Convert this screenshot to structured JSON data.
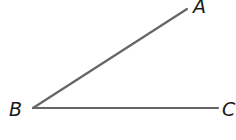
{
  "diagram": {
    "type": "angle",
    "stroke_color": "#666666",
    "label_color": "#1a1a1a",
    "vertex": {
      "name": "B",
      "x": 33,
      "y": 108
    },
    "rays": [
      {
        "name": "BA",
        "from": "B",
        "to": "A",
        "x1": 33,
        "y1": 108,
        "x2": 187,
        "y2": 9
      },
      {
        "name": "BC",
        "from": "B",
        "to": "C",
        "x1": 33,
        "y1": 108,
        "x2": 218,
        "y2": 108
      }
    ],
    "points": [
      {
        "label": "A",
        "x": 187,
        "y": 9
      },
      {
        "label": "B",
        "x": 33,
        "y": 108
      },
      {
        "label": "C",
        "x": 218,
        "y": 108
      }
    ],
    "labels": {
      "a": "A",
      "b": "B",
      "c": "C"
    }
  }
}
